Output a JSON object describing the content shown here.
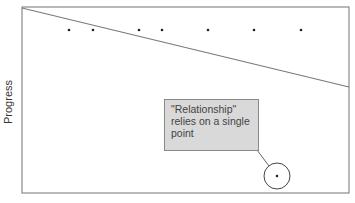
{
  "chart_data": {
    "type": "scatter",
    "title": "",
    "xlabel": "",
    "ylabel": "Progress",
    "grid": false,
    "points": [
      {
        "x": 69,
        "y": 30
      },
      {
        "x": 93,
        "y": 30
      },
      {
        "x": 139,
        "y": 30
      },
      {
        "x": 162,
        "y": 30
      },
      {
        "x": 208,
        "y": 30
      },
      {
        "x": 254,
        "y": 30
      },
      {
        "x": 301,
        "y": 30
      },
      {
        "x": 277,
        "y": 176,
        "highlighted": true
      }
    ],
    "trend_line": {
      "x1": 22,
      "y1": 8,
      "x2": 349,
      "y2": 87
    },
    "annotation": "\"Relationship\" relies on a single point"
  },
  "labels": {
    "ylabel": "Progress",
    "callout": "\"Relationship\" relies on a single point"
  },
  "colors": {
    "axis": "#8a8a8a",
    "line": "#7a7a7a",
    "point": "#222222",
    "callout_bg": "#d9d9d9"
  }
}
